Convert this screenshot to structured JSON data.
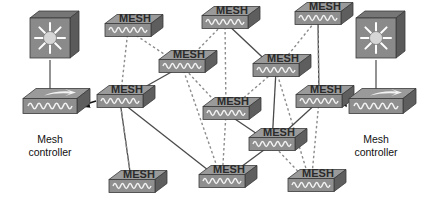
{
  "diagram": {
    "background_color": "#ffffff",
    "node_label": "MESH",
    "node_top_color": "#9a9a9a",
    "node_front_color": "#8f8f8f",
    "node_side_color": "#5e5e5e",
    "node_outline_color": "#3a3a3a",
    "wave_color": "#f2f2f2",
    "solid_link_color": "#4a4a4a",
    "dashed_link_color": "#8c8c8c",
    "arrow_color": "#111111",
    "controller_caption_line1": "Mesh",
    "controller_caption_line2": "controller",
    "ap_body_color": "#8a8a8a",
    "ap_side_color": "#5a5a5a",
    "ap_ray_color": "#ffffff"
  },
  "controllers": [
    {
      "id": "controller-left",
      "side": "left",
      "caption_line1": "Mesh",
      "caption_line2": "controller",
      "ap_x": 50,
      "ap_y": 38,
      "switch_x": 50,
      "switch_y": 106,
      "caption_x": 50,
      "caption_y": 143
    },
    {
      "id": "controller-right",
      "side": "right",
      "caption_line1": "Mesh",
      "caption_line2": "controller",
      "ap_x": 376,
      "ap_y": 38,
      "switch_x": 376,
      "switch_y": 106,
      "caption_x": 376,
      "caption_y": 143
    }
  ],
  "mesh_nodes": [
    {
      "id": "mesh-top-left",
      "label": "MESH",
      "x": 128,
      "y": 30
    },
    {
      "id": "mesh-top-center",
      "label": "MESH",
      "x": 225,
      "y": 22
    },
    {
      "id": "mesh-top-right",
      "label": "MESH",
      "x": 318,
      "y": 18
    },
    {
      "id": "mesh-mid-left",
      "label": "MESH",
      "x": 120,
      "y": 101
    },
    {
      "id": "mesh-mid-centerleft",
      "label": "MESH",
      "x": 182,
      "y": 66
    },
    {
      "id": "mesh-mid-centerright",
      "label": "MESH",
      "x": 276,
      "y": 70
    },
    {
      "id": "mesh-center",
      "label": "MESH",
      "x": 226,
      "y": 113
    },
    {
      "id": "mesh-right-upper",
      "label": "MESH",
      "x": 319,
      "y": 101
    },
    {
      "id": "mesh-right-mid",
      "label": "MESH",
      "x": 272,
      "y": 144
    },
    {
      "id": "mesh-bottom-left",
      "label": "MESH",
      "x": 132,
      "y": 186
    },
    {
      "id": "mesh-bottom-center",
      "label": "MESH",
      "x": 222,
      "y": 181
    },
    {
      "id": "mesh-bottom-right",
      "label": "MESH",
      "x": 311,
      "y": 185
    }
  ],
  "links": [
    {
      "from": "mesh-top-left",
      "to": "mesh-mid-left",
      "style": "dashed"
    },
    {
      "from": "mesh-top-left",
      "to": "mesh-mid-centerleft",
      "style": "dashed"
    },
    {
      "from": "mesh-top-center",
      "to": "mesh-mid-centerleft",
      "style": "dashed"
    },
    {
      "from": "mesh-top-center",
      "to": "mesh-center",
      "style": "dashed"
    },
    {
      "from": "mesh-top-center",
      "to": "mesh-mid-centerright",
      "style": "solid"
    },
    {
      "from": "mesh-top-right",
      "to": "mesh-mid-centerright",
      "style": "dashed"
    },
    {
      "from": "mesh-top-right",
      "to": "mesh-right-upper",
      "style": "solid"
    },
    {
      "from": "mesh-top-right",
      "to": "mesh-right-upper",
      "style": "dashed"
    },
    {
      "from": "mesh-mid-left",
      "to": "mesh-mid-centerleft",
      "style": "solid"
    },
    {
      "from": "mesh-mid-left",
      "to": "mesh-bottom-left",
      "style": "solid"
    },
    {
      "from": "mesh-mid-left",
      "to": "mesh-bottom-left",
      "style": "dashed"
    },
    {
      "from": "mesh-mid-left",
      "to": "mesh-bottom-center",
      "style": "solid"
    },
    {
      "from": "mesh-mid-centerleft",
      "to": "mesh-center",
      "style": "dashed"
    },
    {
      "from": "mesh-mid-centerleft",
      "to": "mesh-bottom-center",
      "style": "dashed"
    },
    {
      "from": "mesh-mid-centerright",
      "to": "mesh-center",
      "style": "dashed"
    },
    {
      "from": "mesh-mid-centerright",
      "to": "mesh-right-mid",
      "style": "solid"
    },
    {
      "from": "mesh-mid-centerright",
      "to": "mesh-bottom-right",
      "style": "dashed"
    },
    {
      "from": "mesh-center",
      "to": "mesh-right-mid",
      "style": "solid"
    },
    {
      "from": "mesh-center",
      "to": "mesh-bottom-center",
      "style": "dashed"
    },
    {
      "from": "mesh-right-upper",
      "to": "mesh-bottom-right",
      "style": "dashed"
    },
    {
      "from": "mesh-right-mid",
      "to": "mesh-bottom-center",
      "style": "solid"
    },
    {
      "from": "mesh-right-mid",
      "to": "mesh-bottom-right",
      "style": "dashed"
    },
    {
      "from": "mesh-right-mid",
      "to": "mesh-right-upper",
      "style": "solid"
    }
  ],
  "controller_links": [
    {
      "from": "controller-left",
      "to": "mesh-mid-left",
      "style": "arrow",
      "direction": "to-controller"
    },
    {
      "from": "controller-right",
      "to": "mesh-right-upper",
      "style": "arrow",
      "direction": "to-controller"
    }
  ]
}
